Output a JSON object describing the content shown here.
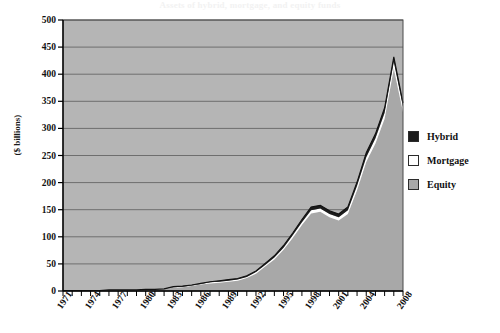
{
  "chart_data": {
    "type": "area",
    "stacked": true,
    "title": "Assets of hybrid, mortgage, and equity funds",
    "xlabel": "",
    "ylabel": "($ billions)",
    "ylim": [
      0,
      500
    ],
    "ytick_values": [
      0,
      50,
      100,
      150,
      200,
      250,
      300,
      350,
      400,
      450,
      500
    ],
    "ytick_labels": [
      "0",
      "50",
      "100",
      "150",
      "200",
      "250",
      "300",
      "350",
      "400",
      "450",
      "500"
    ],
    "grid": true,
    "legend_position": "right",
    "xlim": [
      1971,
      2008
    ],
    "xtick_labels": [
      "1971",
      "1974",
      "1977",
      "1980",
      "1983",
      "1986",
      "1989",
      "1992",
      "1995",
      "1998",
      "2001",
      "2004",
      "2008"
    ],
    "xtick_values": [
      1971,
      1974,
      1977,
      1980,
      1983,
      1986,
      1989,
      1992,
      1995,
      1998,
      2001,
      2004,
      2008
    ],
    "x": [
      1971,
      1972,
      1973,
      1974,
      1975,
      1976,
      1977,
      1978,
      1979,
      1980,
      1981,
      1982,
      1983,
      1984,
      1985,
      1986,
      1987,
      1988,
      1989,
      1990,
      1991,
      1992,
      1993,
      1994,
      1995,
      1996,
      1997,
      1998,
      1999,
      2000,
      2001,
      2002,
      2003,
      2004,
      2005,
      2006,
      2007,
      2008
    ],
    "series": [
      {
        "name": "Equity",
        "color": "#a8a8a8",
        "values": [
          1,
          1,
          1,
          1,
          1,
          2,
          2,
          2,
          2,
          3,
          3,
          4,
          6,
          7,
          9,
          12,
          14,
          15,
          17,
          19,
          24,
          32,
          45,
          58,
          76,
          98,
          122,
          143,
          146,
          136,
          130,
          142,
          186,
          238,
          272,
          318,
          410,
          330
        ]
      },
      {
        "name": "Mortgage",
        "color": "#ffffff",
        "values": [
          0,
          0,
          0,
          0,
          0,
          0,
          0,
          0,
          0,
          0,
          0,
          0,
          1,
          1,
          1,
          1,
          2,
          2,
          2,
          2,
          2,
          3,
          3,
          4,
          4,
          5,
          5,
          6,
          6,
          6,
          6,
          7,
          8,
          9,
          10,
          11,
          13,
          10
        ]
      },
      {
        "name": "Hybrid",
        "color": "#1c1c1c",
        "values": [
          0,
          0,
          0,
          0,
          0,
          0,
          0,
          0,
          0,
          0,
          0,
          0,
          1,
          1,
          1,
          1,
          1,
          2,
          2,
          2,
          2,
          2,
          3,
          3,
          4,
          4,
          5,
          6,
          6,
          6,
          6,
          6,
          7,
          8,
          8,
          9,
          9,
          7
        ]
      }
    ],
    "peak": {
      "year": 2007,
      "value": 432
    },
    "plot_bg": "#b5b5b5",
    "grid_color": "#6e6e6e",
    "axis_color": "#000000"
  }
}
